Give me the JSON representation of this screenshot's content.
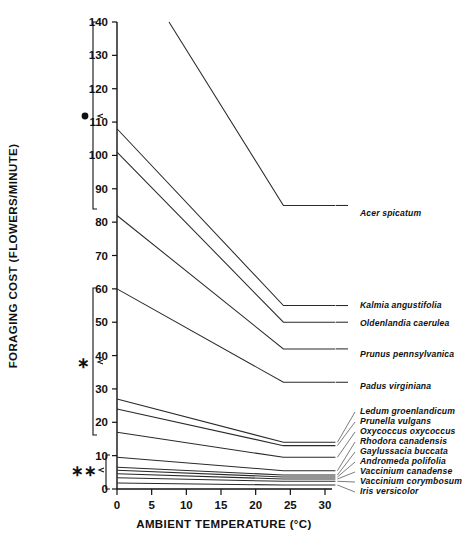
{
  "chart_data": {
    "type": "line",
    "title": "",
    "xlabel": "AMBIENT TEMPERATURE (°C)",
    "ylabel": "FORAGING COST (FLOWERS/MINUTE)",
    "xlim": [
      0,
      32
    ],
    "ylim": [
      0,
      140
    ],
    "xticks": [
      0,
      5,
      10,
      15,
      20,
      25,
      30
    ],
    "yticks": [
      0,
      10,
      20,
      30,
      40,
      50,
      60,
      70,
      80,
      90,
      100,
      110,
      120,
      130,
      140
    ],
    "grid": false,
    "legend_position": "right-inline-labels",
    "series": [
      {
        "name": "Acer spicatum",
        "x": [
          7.5,
          24,
          31.5
        ],
        "y": [
          140,
          85,
          85
        ]
      },
      {
        "name": "Kalmia angustifolia",
        "x": [
          0,
          24,
          31.5
        ],
        "y": [
          108,
          55,
          55
        ]
      },
      {
        "name": "Oldenlandia caerulea",
        "x": [
          0,
          24,
          31.5
        ],
        "y": [
          101,
          50,
          50
        ]
      },
      {
        "name": "Prunus pennsylvanica",
        "x": [
          0,
          24,
          31.5
        ],
        "y": [
          82,
          42,
          42
        ]
      },
      {
        "name": "Padus virginiana",
        "x": [
          0,
          24,
          31.5
        ],
        "y": [
          60,
          32,
          32
        ]
      },
      {
        "name": "Ledum groenlandicum",
        "x": [
          0,
          24,
          31.5
        ],
        "y": [
          27,
          14,
          14
        ]
      },
      {
        "name": "Prunella vulgans",
        "x": [
          0,
          24,
          31.5
        ],
        "y": [
          24,
          13,
          13
        ]
      },
      {
        "name": "Oxycoccus oxycoccus",
        "x": [
          0,
          24,
          31.5
        ],
        "y": [
          17,
          9.5,
          9.5
        ]
      },
      {
        "name": "Rhodora canadensis",
        "x": [
          0,
          24,
          31.5
        ],
        "y": [
          9.5,
          5.5,
          5.5
        ]
      },
      {
        "name": "Gaylussacia buccata",
        "x": [
          0,
          24,
          31.5
        ],
        "y": [
          6.5,
          4.2,
          4.2
        ]
      },
      {
        "name": "Andromeda polifolia",
        "x": [
          0,
          24,
          31.5
        ],
        "y": [
          5.6,
          3.6,
          3.6
        ]
      },
      {
        "name": "Vaccinium canadense",
        "x": [
          0,
          24,
          31.5
        ],
        "y": [
          4.6,
          3.0,
          3.0
        ]
      },
      {
        "name": "Vaccinium corymbosum",
        "x": [
          0,
          24,
          31.5
        ],
        "y": [
          3.4,
          2.3,
          2.3
        ]
      },
      {
        "name": "Iris versicolor",
        "x": [
          0,
          24,
          31.5
        ],
        "y": [
          1.8,
          1.2,
          1.2
        ]
      }
    ],
    "annotations": [
      {
        "symbol": "●",
        "label": "filled-circle",
        "y_range": [
          80,
          140
        ],
        "note": "significance bracket for upper group"
      },
      {
        "symbol": "∗",
        "label": "single-asterisk",
        "y_range": [
          16,
          60
        ],
        "note": "significance bracket for middle group"
      },
      {
        "symbol": "∗∗",
        "label": "double-asterisk",
        "y_range": [
          0,
          10
        ],
        "note": "significance bracket for lower group"
      }
    ]
  },
  "axes": {
    "y": {
      "title": "FORAGING COST (FLOWERS/MINUTE)",
      "ticks": [
        "140",
        "130",
        "120",
        "110",
        "100",
        "90",
        "80",
        "70",
        "60",
        "50",
        "40",
        "30",
        "20",
        "10",
        "0"
      ]
    },
    "x": {
      "title": "AMBIENT TEMPERATURE (°C)",
      "ticks": [
        "0",
        "5",
        "10",
        "15",
        "20",
        "25",
        "30"
      ]
    }
  },
  "marks": {
    "circle": "●",
    "single_asterisk": "∗",
    "double_asterisk": "∗∗"
  },
  "species_labels": [
    "Acer spicatum",
    "Kalmia angustifolia",
    "Oldenlandia caerulea",
    "Prunus pennsylvanica",
    "Padus virginiana",
    "Ledum groenlandicum",
    "Prunella vulgans",
    "Oxycoccus oxycoccus",
    "Rhodora canadensis",
    "Gaylussacia buccata",
    "Andromeda polifolia",
    "Vaccinium canadense",
    "Vaccinium corymbosum",
    "Iris versicolor"
  ]
}
